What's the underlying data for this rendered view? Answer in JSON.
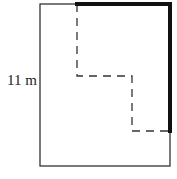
{
  "diagram": {
    "side_label": "11 m",
    "outer_rect": {
      "x": 40,
      "y": 4,
      "width": 130,
      "height": 162,
      "stroke": "#333333"
    },
    "thick_path": {
      "points": "77,4 170,4 170,131",
      "stroke": "#111111",
      "width": 4
    },
    "dashed_path": {
      "points": "77,4 77,76 132,76 132,131 170,131",
      "stroke": "#333333",
      "dash": "8,6"
    }
  }
}
